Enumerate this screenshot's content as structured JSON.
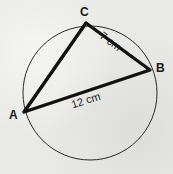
{
  "figure": {
    "type": "circle-inscribed-triangle-diagram",
    "background_color": "#e9e9e7",
    "stroke_color": "#1a1a1a",
    "circle": {
      "center_x": 90,
      "center_y": 93,
      "radius": 67,
      "stroke_width": 1
    },
    "triangle": {
      "stroke_width": 3.4,
      "vertices": [
        {
          "name": "A",
          "label": "A",
          "x": 24,
          "y": 112
        },
        {
          "name": "C",
          "label": "C",
          "x": 86,
          "y": 23
        },
        {
          "name": "B",
          "label": "B",
          "x": 150,
          "y": 70
        }
      ]
    },
    "side_labels": [
      {
        "name": "CB",
        "text": "7 cm",
        "rotation_deg": 36.3
      },
      {
        "name": "AB",
        "text": "12 cm",
        "rotation_deg": -18.0
      }
    ]
  }
}
